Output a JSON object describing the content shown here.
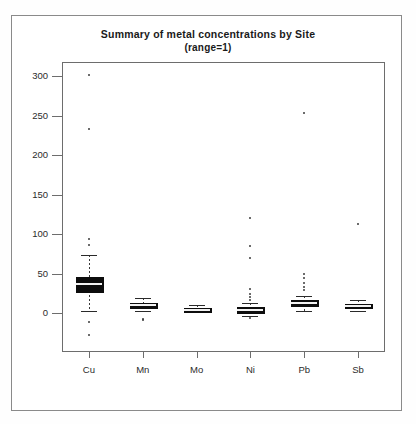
{
  "chart_data": {
    "type": "box",
    "title": "Summary of metal concentrations by Site",
    "subtitle": "(range=1)",
    "xlabel": "",
    "ylabel": "",
    "ylim": [
      -40,
      315
    ],
    "yticks": [
      0,
      50,
      100,
      150,
      200,
      250,
      300
    ],
    "ytick_labels": [
      "0",
      "50",
      "100",
      "150",
      "200",
      "250",
      "300"
    ],
    "categories": [
      "Cu",
      "Mn",
      "Mo",
      "Ni",
      "Pb",
      "Sb"
    ],
    "grid": false,
    "legend": false,
    "series": [
      {
        "name": "Cu",
        "min_whisker": 3,
        "q1": 28,
        "median": 37,
        "q3": 46,
        "max_whisker": 73,
        "outliers": [
          301,
          233,
          94,
          86,
          -12,
          -28
        ]
      },
      {
        "name": "Mn",
        "min_whisker": 3,
        "q1": 7,
        "median": 10,
        "q3": 13,
        "max_whisker": 19,
        "outliers": [
          -7,
          -9
        ]
      },
      {
        "name": "Mo",
        "min_whisker": 1,
        "q1": 3,
        "median": 4,
        "q3": 6,
        "max_whisker": 10,
        "outliers": []
      },
      {
        "name": "Ni",
        "min_whisker": -4,
        "q1": 1,
        "median": 4,
        "q3": 7,
        "max_whisker": 13,
        "outliers": [
          120,
          85,
          70,
          30,
          24,
          20,
          17,
          -6
        ]
      },
      {
        "name": "Pb",
        "min_whisker": 3,
        "q1": 10,
        "median": 13,
        "q3": 16,
        "max_whisker": 22,
        "outliers": [
          253,
          49,
          44,
          38,
          33,
          29
        ]
      },
      {
        "name": "Sb",
        "min_whisker": 2,
        "q1": 7,
        "median": 9,
        "q3": 11,
        "max_whisker": 17,
        "outliers": [
          113
        ]
      }
    ]
  }
}
